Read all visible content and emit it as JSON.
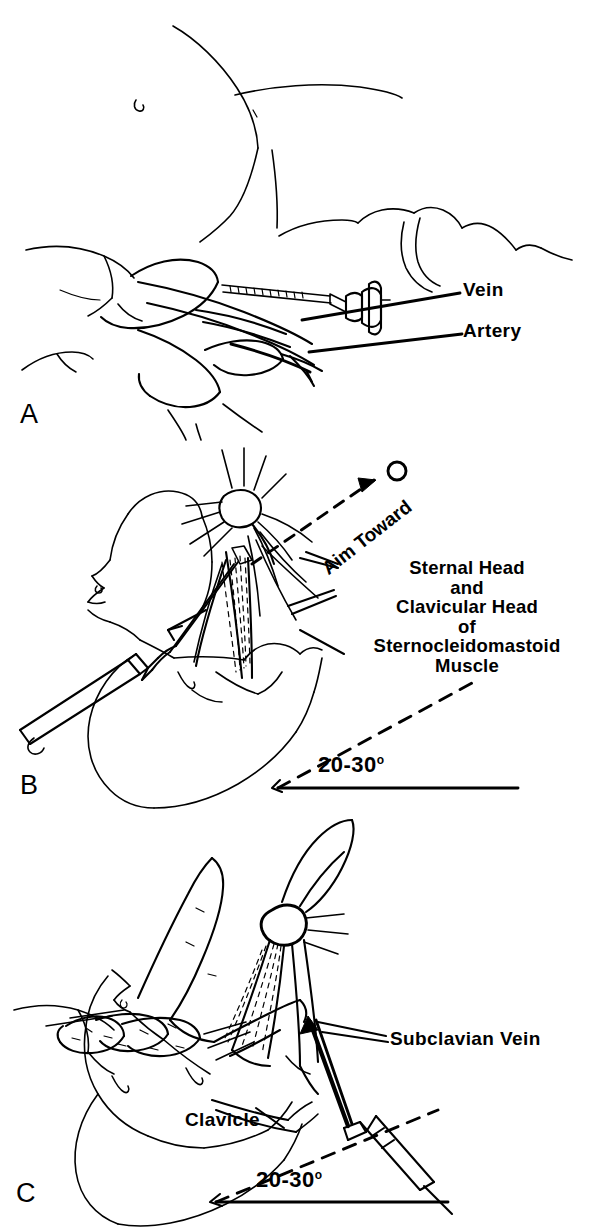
{
  "figure": {
    "type": "medical-line-illustration",
    "background_color": "#ffffff",
    "ink_color": "#000000",
    "panel_count": 3
  },
  "panels": [
    {
      "letter": "A",
      "name": "panel-a",
      "description": "Hand palpating vessels with needle and syringe entering at an oblique angle; vein and artery indicated by leader lines",
      "labels": [
        {
          "text": "Vein",
          "name": "label-vein"
        },
        {
          "text": "Artery",
          "name": "label-artery"
        }
      ]
    },
    {
      "letter": "B",
      "name": "panel-b",
      "description": "Head turned in profile, syringe advanced toward the ipsilateral nipple at the apex of the sternocleidomastoid triangle",
      "labels": [
        {
          "text": "Aim Toward",
          "name": "label-aim-toward"
        }
      ],
      "stacked_label": {
        "name": "label-sternocleidomastoid",
        "lines": [
          "Sternal Head",
          "and",
          "Clavicular Head",
          "of",
          "Sternocleidomastoid",
          "Muscle"
        ]
      },
      "angle_annotation": {
        "name": "angle-20-30-b",
        "value": "20-30",
        "unit": "o"
      }
    },
    {
      "letter": "C",
      "name": "panel-c",
      "description": "Fingers straddling the clavicle while the needle is directed beneath it toward the subclavian vein",
      "labels": [
        {
          "text": "Subclavian Vein",
          "name": "label-subclavian-vein"
        },
        {
          "text": "Clavicle",
          "name": "label-clavicle"
        }
      ],
      "angle_annotation": {
        "name": "angle-20-30-c",
        "value": "20-30",
        "unit": "o"
      }
    }
  ]
}
